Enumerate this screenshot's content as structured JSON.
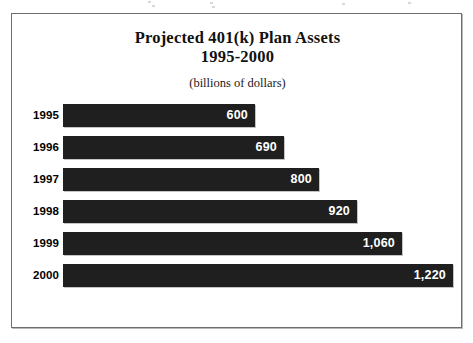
{
  "chart_data": {
    "type": "bar",
    "orientation": "horizontal",
    "title": "Projected 401(k) Plan Assets",
    "title_line2": "1995-2000",
    "subtitle": "(billions of dollars)",
    "xlabel": "",
    "ylabel": "",
    "grid": false,
    "legend": "none",
    "xlim": [
      0,
      1220
    ],
    "categories": [
      "1995",
      "1996",
      "1997",
      "1998",
      "1999",
      "2000"
    ],
    "values": [
      600,
      690,
      800,
      920,
      1060,
      1220
    ],
    "value_labels": [
      "600",
      "690",
      "800",
      "920",
      "1,060",
      "1,220"
    ],
    "bar_color": "#201f1f",
    "label_color": "#ffffff",
    "bars": [
      {
        "category": "1995",
        "value": 600,
        "label": "600"
      },
      {
        "category": "1996",
        "value": 690,
        "label": "690"
      },
      {
        "category": "1997",
        "value": 800,
        "label": "800"
      },
      {
        "category": "1998",
        "value": 920,
        "label": "920"
      },
      {
        "category": "1999",
        "value": 1060,
        "label": "1,060"
      },
      {
        "category": "2000",
        "value": 1220,
        "label": "1,220"
      }
    ]
  }
}
